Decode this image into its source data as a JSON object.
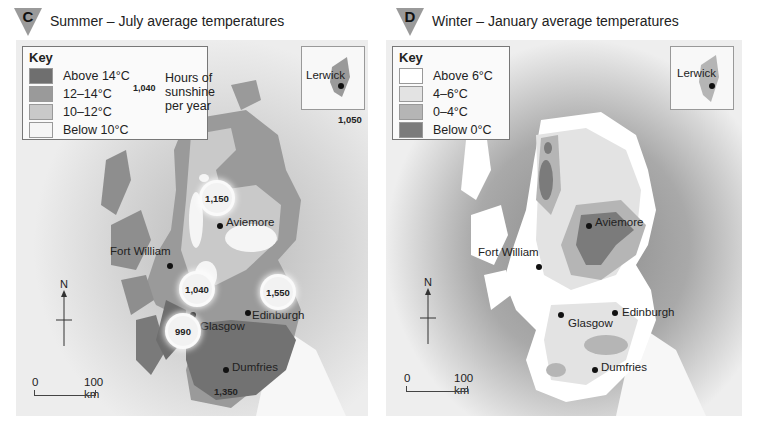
{
  "panels": [
    {
      "id": "C",
      "badge": "C",
      "title": "Summer – July average temperatures",
      "key": {
        "title": "Key",
        "items": [
          {
            "label": "Above 14°C",
            "color": "#6f6f6f"
          },
          {
            "label": "12–14°C",
            "color": "#9a9a9a"
          },
          {
            "label": "10–12°C",
            "color": "#c9c9c9"
          },
          {
            "label": "Below 10°C",
            "color": "#f5f5f5"
          }
        ],
        "sunshine_sample": "1,040",
        "sunshine_label": [
          "Hours of",
          "sunshine",
          "per year"
        ]
      },
      "places": {
        "lerwick": "Lerwick",
        "aviemore": "Aviemore",
        "fort_william": "Fort William",
        "glasgow": "Glasgow",
        "edinburgh": "Edinburgh",
        "dumfries": "Dumfries"
      },
      "sunshine": {
        "lerwick": "1,050",
        "aviemore_north": "1,150",
        "central": "1,040",
        "edinburgh": "1,550",
        "glasgow": "990",
        "dumfries": "1,350"
      },
      "north_label": "N",
      "scale": {
        "start": "0",
        "end": "100 km"
      }
    },
    {
      "id": "D",
      "badge": "D",
      "title": "Winter – January average temperatures",
      "key": {
        "title": "Key",
        "items": [
          {
            "label": "Above 6°C",
            "color": "#ffffff"
          },
          {
            "label": "4–6°C",
            "color": "#e3e3e3"
          },
          {
            "label": "0–4°C",
            "color": "#b5b5b5"
          },
          {
            "label": "Below 0°C",
            "color": "#7b7b7b"
          }
        ]
      },
      "places": {
        "lerwick": "Lerwick",
        "aviemore": "Aviemore",
        "fort_william": "Fort William",
        "glasgow": "Glasgow",
        "edinburgh": "Edinburgh",
        "dumfries": "Dumfries"
      },
      "north_label": "N",
      "scale": {
        "start": "0",
        "end": "100 km"
      }
    }
  ]
}
